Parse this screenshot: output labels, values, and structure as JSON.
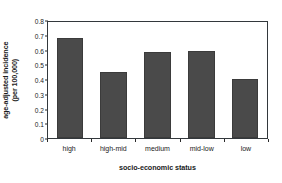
{
  "chart_data": {
    "type": "bar",
    "title": "",
    "subtitle": "",
    "xlabel": "socio-economic status",
    "ylabel": "age-adjusted incidence (per 100,000)",
    "ylabel_line1": "age-adjusted incidence",
    "ylabel_line2": "(per 100,000)",
    "categories": [
      "high",
      "high-mid",
      "medium",
      "mid-low",
      "low"
    ],
    "values": [
      0.68,
      0.45,
      0.58,
      0.59,
      0.4
    ],
    "ylim": [
      0,
      0.8
    ],
    "yticks": [
      0.8,
      0.7,
      0.6,
      0.5,
      0.4,
      0.3,
      0.2,
      0.1,
      0
    ],
    "ytick_labels": [
      "0.8",
      "0.7",
      "0.6",
      "0.5",
      "0.4",
      "0.3",
      "0.2",
      "0.1",
      "0"
    ],
    "grid": false,
    "legend": false,
    "legend_position": "none",
    "bar_color": "#4a4a4a",
    "bar_edge_color": "#3b3b3b",
    "axis_color": "#33383c",
    "background_color": "#ffffff"
  }
}
